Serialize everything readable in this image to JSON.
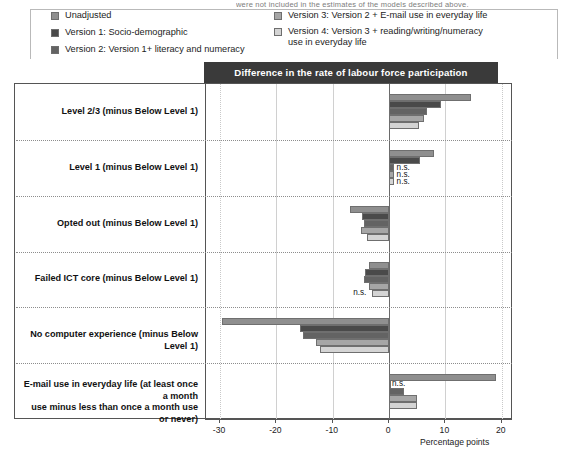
{
  "top_strip_text": "were not included in the estimates of the models described above.",
  "legend": {
    "columns": [
      {
        "items": [
          {
            "label": "Unadjusted",
            "color": "#8f8f8f",
            "key": "unadjusted"
          },
          {
            "label": "Version 1: Socio-demographic",
            "color": "#4a4a4a",
            "key": "v1"
          },
          {
            "label": "Version 2: Version 1+ literacy and numeracy",
            "color": "#636363",
            "key": "v2"
          }
        ]
      },
      {
        "items": [
          {
            "label": "Version 3: Version 2 + E-mail use  in everyday life",
            "color": "#a6a6a6",
            "key": "v3"
          },
          {
            "label": "Version 4: Version 3 + reading/writing/numeracy\nuse in everyday life",
            "color": "#d4d4d4",
            "key": "v4"
          }
        ]
      }
    ]
  },
  "chart_data": {
    "type": "bar",
    "orientation": "horizontal",
    "title": "Difference in the rate of labour force participation",
    "xlabel": "Percentage points",
    "ylabel": "",
    "xlim": [
      -32.5,
      22
    ],
    "xticks": [
      -30,
      -20,
      -10,
      0,
      20
    ],
    "xticklabels": [
      "-30",
      "-20",
      "-10",
      "0",
      "10",
      "20"
    ],
    "xticks_full": [
      -30,
      -20,
      -10,
      0,
      10,
      20
    ],
    "grid": true,
    "legend_position": "top",
    "categories": [
      "Level 2/3  (minus Below Level 1)",
      "Level 1  (minus Below Level 1)",
      "Opted out  (minus Below Level 1)",
      "Failed ICT core  (minus Below Level 1)",
      "No computer experience (minus Below Level 1)",
      "E-mail use in everyday life (at least once a month\nuse minus less than once a month use or never)"
    ],
    "series": [
      {
        "name": "Unadjusted",
        "color": "#8f8f8f",
        "values": [
          14.5,
          8.0,
          -7.0,
          -3.6,
          -29.7,
          19.0
        ],
        "significance": [
          "",
          "",
          "",
          "",
          "",
          ""
        ]
      },
      {
        "name": "Version 1: Socio-demographic",
        "color": "#4a4a4a",
        "values": [
          9.3,
          5.5,
          -4.8,
          -4.2,
          -15.9,
          0.0
        ],
        "significance": [
          "",
          "",
          "",
          "",
          "",
          "n.s."
        ]
      },
      {
        "name": "Version 2: Version 1+ literacy and numeracy",
        "color": "#636363",
        "values": [
          6.8,
          0.8,
          -4.4,
          -4.5,
          -15.3,
          2.6
        ],
        "significance": [
          "",
          "n.s.",
          "",
          "",
          "",
          ""
        ]
      },
      {
        "name": "Version 3: Version 2 + E-mail use in everyday life",
        "color": "#a6a6a6",
        "values": [
          6.2,
          0.8,
          -5.0,
          -3.5,
          -13.0,
          5.0
        ],
        "significance": [
          "",
          "n.s.",
          "",
          "",
          "",
          ""
        ]
      },
      {
        "name": "Version 4: Version 3 + reading/writing/numeracy use in everyday life",
        "color": "#d4d4d4",
        "values": [
          5.3,
          0.8,
          -4.0,
          -3.0,
          -12.3,
          5.0
        ],
        "significance": [
          "",
          "n.s.",
          "",
          "n.s.",
          "",
          ""
        ]
      }
    ]
  }
}
